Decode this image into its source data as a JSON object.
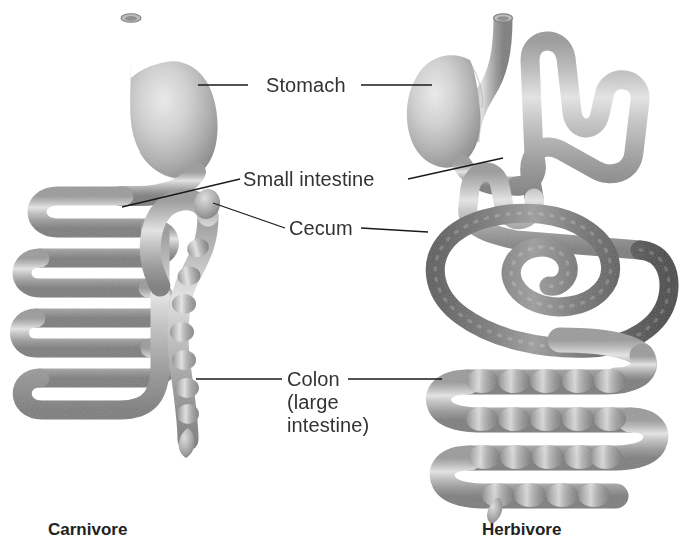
{
  "diagram": {
    "title_visible": false,
    "background_color": "#ffffff",
    "labels": [
      {
        "id": "stomach",
        "text": "Stomach",
        "x": 266,
        "y": 74
      },
      {
        "id": "small_intestine",
        "text": "Small intestine",
        "x": 243,
        "y": 168
      },
      {
        "id": "cecum",
        "text": "Cecum",
        "x": 289,
        "y": 217
      },
      {
        "id": "colon_l1",
        "text": "Colon",
        "x": 287,
        "y": 368
      },
      {
        "id": "colon_l2",
        "text": "(large",
        "x": 287,
        "y": 391
      },
      {
        "id": "colon_l3",
        "text": "intestine)",
        "x": 287,
        "y": 414
      }
    ],
    "captions": [
      {
        "id": "carnivore",
        "text": "Carnivore",
        "x": 48,
        "y": 520
      },
      {
        "id": "herbivore",
        "text": "Herbivore",
        "x": 482,
        "y": 520
      }
    ],
    "colors": {
      "tissue_light_mid": "#a9a9a9",
      "tissue_highlight": "#e2e2e2",
      "tissue_shadow": "#848484",
      "tissue_dark_mid": "#6f6f6f",
      "tissue_dark_hi": "#a6a6a6",
      "tissue_dark_shadow": "#4c4c4c",
      "leader_line": "#1a1a1a",
      "label_text": "#333333",
      "caption_text": "#222222",
      "background": "#ffffff"
    },
    "leaders": [
      {
        "id": "stomach-left",
        "from": [
          248,
          85
        ],
        "to": [
          198,
          85
        ]
      },
      {
        "id": "stomach-right",
        "from": [
          361,
          85
        ],
        "to": [
          432,
          85
        ]
      },
      {
        "id": "small-intestine-left",
        "from": [
          240,
          179
        ],
        "to": [
          122,
          207
        ]
      },
      {
        "id": "small-intestine-right",
        "from": [
          408,
          179
        ],
        "to": [
          503,
          158
        ]
      },
      {
        "id": "cecum-left",
        "from": [
          285,
          228
        ],
        "to": [
          213,
          203
        ]
      },
      {
        "id": "cecum-right",
        "from": [
          361,
          228
        ],
        "to": [
          428,
          232
        ]
      },
      {
        "id": "colon-left",
        "from": [
          282,
          379
        ],
        "to": [
          196,
          379
        ]
      },
      {
        "id": "colon-right",
        "from": [
          348,
          379
        ],
        "to": [
          442,
          379
        ]
      }
    ],
    "parts": {
      "carnivore": {
        "side": "left",
        "esophagus": "short vertical open tube at top",
        "stomach": "J-shaped sac, light tissue",
        "small_intestine": "long serpentine horizontal coils, 6 folds",
        "cecum": "tiny oval nub on colon arch",
        "colon": "beaded vertical tube with bulbous blind tip"
      },
      "herbivore": {
        "side": "right",
        "esophagus": "short vertical open tube at top",
        "stomach": "rounded sac with notch, light tissue",
        "small_intestine": "zigzag folded tube, 3 switchbacks",
        "cecum": "dark spiral coil, about 2.5 turns",
        "colon": "thick beaded horizontal folds, 5 rows with small tail"
      }
    }
  }
}
